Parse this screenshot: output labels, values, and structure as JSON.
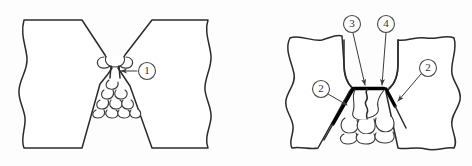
{
  "figure": {
    "background_color": "#fdfdfd",
    "line_color": "#2b2b2b",
    "defect_color": "#000000",
    "bead_color": "#ffffff"
  },
  "diagrams": [
    {
      "id": "left-diagram",
      "name": "incomplete-penetration-diagram",
      "description": "Double-V butt joint cross-section with weld beads and an incomplete root penetration defect",
      "callouts": [
        {
          "id": "callout-1",
          "label": "①",
          "number": "1",
          "circle_cx": 146,
          "circle_cy": 71,
          "circle_r": 8.5,
          "arrow_from_x": 136,
          "arrow_from_y": 71,
          "arrow_to_x": 118,
          "arrow_to_y": 71,
          "points_to": "weld-root-incomplete-penetration"
        }
      ]
    },
    {
      "id": "right-diagram",
      "name": "lack-of-fusion-diagram",
      "description": "U-groove butt joint cross-section showing lack of sidewall fusion and root defects",
      "callouts": [
        {
          "id": "callout-2-left",
          "label": "②",
          "number": "2",
          "circle_cx": 321,
          "circle_cy": 89,
          "circle_r": 8.5,
          "arrow_from_x": 329,
          "arrow_from_y": 94,
          "arrow_to_x": 349,
          "arrow_to_y": 106,
          "points_to": "left-sidewall-lack-of-fusion"
        },
        {
          "id": "callout-2-right",
          "label": "②",
          "number": "2",
          "circle_cx": 428,
          "circle_cy": 68,
          "circle_r": 8.5,
          "arrow_from_x": 420,
          "arrow_from_y": 74,
          "arrow_to_x": 396,
          "arrow_to_y": 102,
          "points_to": "right-sidewall-lack-of-fusion"
        },
        {
          "id": "callout-3",
          "label": "③",
          "number": "3",
          "circle_cx": 352,
          "circle_cy": 24,
          "circle_r": 8.5,
          "arrow_from_x": 354,
          "arrow_from_y": 33,
          "arrow_to_x": 366,
          "arrow_to_y": 87,
          "points_to": "root-defect-left"
        },
        {
          "id": "callout-4",
          "label": "④",
          "number": "4",
          "circle_cx": 386,
          "circle_cy": 24,
          "circle_r": 8.5,
          "arrow_from_x": 386,
          "arrow_from_y": 33,
          "arrow_to_x": 382,
          "arrow_to_y": 87,
          "points_to": "root-defect-right"
        }
      ]
    }
  ]
}
